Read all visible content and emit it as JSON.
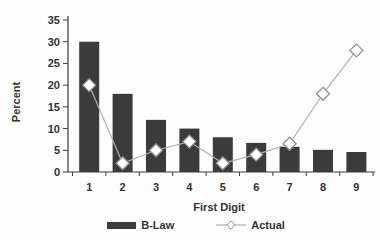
{
  "chart_data": {
    "type": "bar",
    "subtype": "bar-line-combo",
    "title": "",
    "xlabel": "First Digit",
    "ylabel": "Percent",
    "categories": [
      "1",
      "2",
      "3",
      "4",
      "5",
      "6",
      "7",
      "8",
      "9"
    ],
    "series": [
      {
        "name": "B-Law",
        "type": "bar",
        "values": [
          30,
          18,
          12,
          10,
          8,
          6.7,
          5.8,
          5.1,
          4.6
        ]
      },
      {
        "name": "Actual",
        "type": "line",
        "marker": "open-diamond",
        "values": [
          20,
          2,
          5,
          7,
          2,
          4,
          6.5,
          18,
          28
        ]
      }
    ],
    "ylim": [
      0,
      35
    ],
    "yticks": [
      0,
      5,
      10,
      15,
      20,
      25,
      30,
      35
    ],
    "grid": false,
    "legend_position": "bottom",
    "colors": {
      "bar": "#3b3b3b",
      "line": "#b3b3b3",
      "marker_fill": "#ffffff",
      "marker_stroke": "#8f8f8f",
      "axis": "#3d3d3d",
      "text": "#333333",
      "background": "#fdfdfd"
    }
  }
}
